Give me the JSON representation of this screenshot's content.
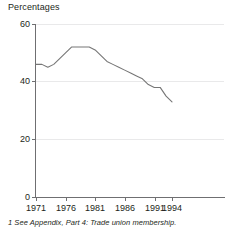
{
  "chart_data": {
    "type": "line",
    "title": "",
    "ylabel": "Percentages",
    "xlabel": "",
    "ylim": [
      0,
      60
    ],
    "xlim": [
      1971,
      1994
    ],
    "grid": true,
    "legend": null,
    "line_color": "#767676",
    "x": [
      1971,
      1972,
      1973,
      1974,
      1975,
      1976,
      1977,
      1978,
      1979,
      1980,
      1981,
      1982,
      1983,
      1984,
      1985,
      1986,
      1987,
      1988,
      1989,
      1990,
      1991,
      1992,
      1993,
      1994
    ],
    "series": [
      {
        "name": "Trade union membership",
        "values": [
          46,
          46,
          45,
          46,
          48,
          50,
          52,
          52,
          52,
          52,
          51,
          49,
          47,
          46,
          45,
          44,
          43,
          42,
          41,
          39,
          38,
          38,
          35,
          33
        ]
      }
    ],
    "yticks": [
      0,
      20,
      40,
      60
    ],
    "ytick_labels": [
      "0",
      "20",
      "40",
      "60"
    ],
    "xticks": [
      1971,
      1976,
      1981,
      1986,
      1991,
      1994
    ],
    "xtick_labels": [
      "1971",
      "1976",
      "1981",
      "1986",
      "1991",
      "1994"
    ]
  },
  "footnote": {
    "text": "1 See Appendix, Part 4: Trade union membership."
  }
}
